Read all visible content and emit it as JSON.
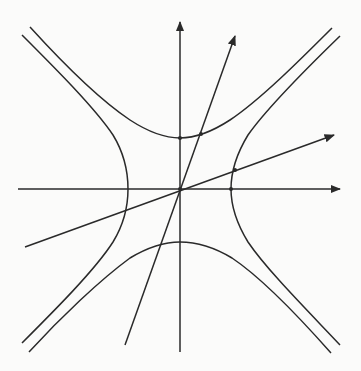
{
  "diagram": {
    "title": "",
    "stroke_color": "#2a2a2a",
    "background_color": "#fbfbfa",
    "origin_px": [
      180,
      189
    ],
    "axes": [
      {
        "name": "x-axis",
        "from": [
          18,
          189
        ],
        "to": [
          342,
          189
        ],
        "arrow": true
      },
      {
        "name": "y-axis",
        "from": [
          180,
          352
        ],
        "to": [
          180,
          20
        ],
        "arrow": true
      }
    ],
    "diameters": [
      {
        "name": "steep-diameter",
        "from": [
          125,
          345
        ],
        "to": [
          236,
          34
        ],
        "arrow": true
      },
      {
        "name": "shallow-diameter",
        "from": [
          25,
          247
        ],
        "to": [
          336,
          134
        ],
        "arrow": true
      }
    ],
    "hyperbolas": [
      {
        "name": "horizontal-hyperbola",
        "equation": "x^2/a^2 - y^2/b^2 = 1",
        "a_px": 51,
        "b_px": 51,
        "branches": [
          "left",
          "right"
        ]
      },
      {
        "name": "vertical-hyperbola",
        "equation": "y^2/b^2 - x^2/a^2 = 1",
        "a_px": 51,
        "b_px": 51,
        "branches": [
          "upper",
          "lower"
        ]
      }
    ],
    "marked_points": [
      {
        "name": "origin",
        "at": [
          180,
          189
        ]
      },
      {
        "name": "upper-vertex",
        "at": [
          180,
          138
        ]
      },
      {
        "name": "right-vertex",
        "at": [
          231,
          189
        ]
      },
      {
        "name": "steep-diameter-intersection",
        "at": [
          201,
          134
        ]
      },
      {
        "name": "shallow-diameter-intersection",
        "at": [
          235,
          170
        ]
      }
    ],
    "labels": []
  }
}
